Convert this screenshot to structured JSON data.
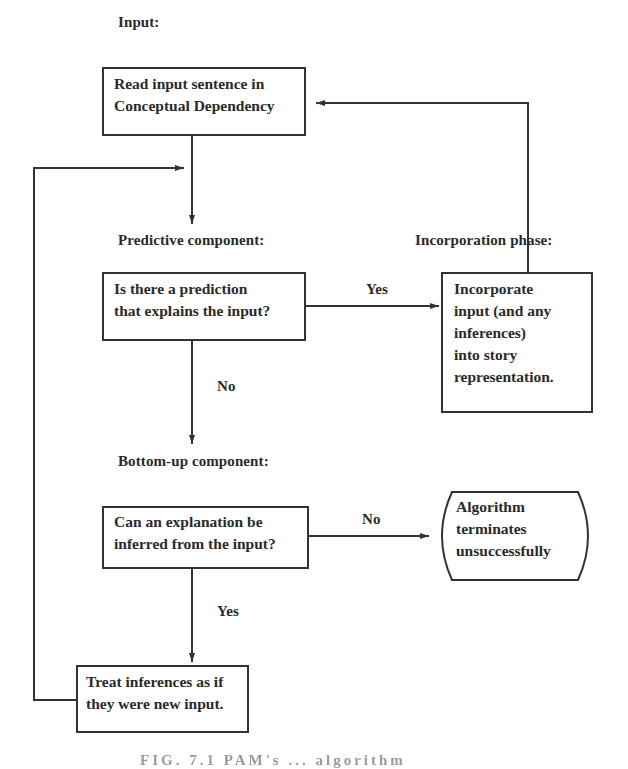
{
  "diagram": {
    "type": "flowchart",
    "section_labels": {
      "input": "Input:",
      "predictive": "Predictive component:",
      "incorporation": "Incorporation phase:",
      "bottom_up": "Bottom-up component:"
    },
    "nodes": {
      "read_input": {
        "lines": [
          "Read input sentence in",
          "Conceptual Dependency"
        ]
      },
      "prediction_check": {
        "lines": [
          "Is there a prediction",
          "that explains the input?"
        ]
      },
      "incorporate": {
        "lines": [
          "Incorporate",
          "input (and any",
          "inferences)",
          "into story",
          "representation."
        ]
      },
      "explanation_check": {
        "lines": [
          "Can an explanation be",
          "inferred from the input?"
        ]
      },
      "terminate": {
        "lines": [
          "Algorithm",
          "terminates",
          "unsuccessfully"
        ]
      },
      "treat_inferences": {
        "lines": [
          "Treat inferences as if",
          "they were new input."
        ]
      }
    },
    "edge_labels": {
      "prediction_yes": "Yes",
      "prediction_no": "No",
      "explanation_no": "No",
      "explanation_yes": "Yes"
    },
    "edges": [
      {
        "from": "read_input",
        "to": "prediction_check",
        "label": ""
      },
      {
        "from": "prediction_check",
        "to": "incorporate",
        "label": "Yes"
      },
      {
        "from": "prediction_check",
        "to": "explanation_check",
        "label": "No"
      },
      {
        "from": "incorporate",
        "to": "read_input",
        "label": ""
      },
      {
        "from": "explanation_check",
        "to": "terminate",
        "label": "No"
      },
      {
        "from": "explanation_check",
        "to": "treat_inferences",
        "label": "Yes"
      },
      {
        "from": "treat_inferences",
        "to": "prediction_check",
        "label": ""
      }
    ],
    "caption": "FIG. 7.1  PAM's ...  algorithm"
  },
  "colors": {
    "ink": "#333333",
    "background": "#ffffff",
    "caption": "#9a9a9a"
  }
}
